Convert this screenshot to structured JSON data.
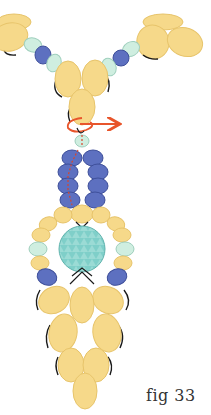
{
  "figure": {
    "label": "fig 33",
    "colors": {
      "yellow_bead": "#f6d98a",
      "yellow_edge": "#e7c46b",
      "blue_bead": "#5d70c0",
      "blue_edge": "#3e4f9a",
      "mint_bead": "#cfeee0",
      "mint_edge": "#9fcfbd",
      "center_stone": "#7fcfc9",
      "thread": "#1a1a1a",
      "path_thread": "#e8552b"
    },
    "elements": {
      "top_necklace": "Two strands of yellow, mint and blue beads converging at a V",
      "bail": "Yellow drop bead with orange thread loop and arrow",
      "ladder": "Two columns of four blue beads with dashed red thread path",
      "center": "Faceted aqua round stone surrounded by yellow, mint and blue beads",
      "fringe": "Inverted triangle cluster of yellow drop beads"
    }
  }
}
